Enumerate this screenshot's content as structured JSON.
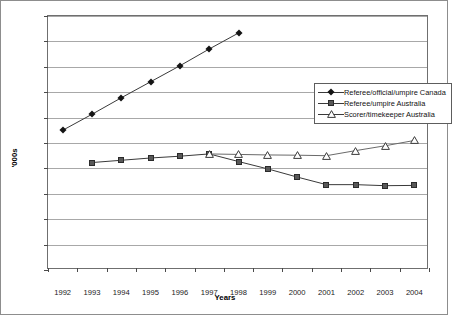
{
  "axes": {
    "ylabel": "'000s",
    "xlabel": "Years",
    "ytick_labels": [
      "0",
      "100",
      "200",
      "300",
      "400",
      "500",
      "600",
      "700",
      "800",
      "900",
      "1,000"
    ],
    "xtick_labels": [
      "1992",
      "1993",
      "1994",
      "1995",
      "1996",
      "1997",
      "1998",
      "1999",
      "2000",
      "2001",
      "2002",
      "2003",
      "2004"
    ]
  },
  "legend": {
    "items": [
      {
        "label": "Referee/official/umpire Canada",
        "marker": "diamond-marker",
        "color": "#141414"
      },
      {
        "label": "Referee/umpire Australia",
        "marker": "square-marker",
        "color": "#585858"
      },
      {
        "label": "Scorer/timekeeper Australia",
        "marker": "triangle-marker",
        "color": "#ffffff"
      }
    ]
  },
  "chart_data": {
    "type": "line",
    "title": "",
    "xlabel": "Years",
    "ylabel": "'000s",
    "ylim": [
      0,
      1000
    ],
    "ytick_step": 100,
    "grid": true,
    "legend_position": "inside-upper-right",
    "x": [
      1992,
      1993,
      1994,
      1995,
      1996,
      1997,
      1998,
      1999,
      2000,
      2001,
      2002,
      2003,
      2004
    ],
    "series": [
      {
        "name": "Referee/official/umpire Canada",
        "marker": "diamond",
        "values": [
          550,
          613,
          678,
          741,
          804,
          870,
          933,
          null,
          null,
          null,
          null,
          null,
          null
        ]
      },
      {
        "name": "Referee/umpire Australia",
        "marker": "square",
        "values": [
          null,
          423,
          432,
          441,
          448,
          457,
          427,
          398,
          366,
          336,
          336,
          332,
          333
        ]
      },
      {
        "name": "Scorer/timekeeper Australia",
        "marker": "triangle",
        "values": [
          null,
          null,
          null,
          null,
          null,
          457,
          455,
          453,
          452,
          450,
          470,
          489,
          510
        ]
      }
    ]
  }
}
